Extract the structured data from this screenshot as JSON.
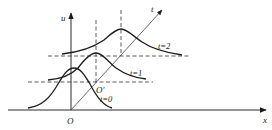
{
  "diagram": {
    "title": "",
    "axes": {
      "u_label": "u",
      "x_label": "x",
      "t_label": "t",
      "origin_label": "O",
      "moving_origin_label": "O′"
    },
    "curves": [
      {
        "label": "t=0",
        "peak_x": 74,
        "peak_y": 68
      },
      {
        "label": "t=1",
        "peak_x": 96,
        "peak_y": 53
      },
      {
        "label": "t=2",
        "peak_x": 121,
        "peak_y": 29
      }
    ],
    "colors": {
      "line": "#1e1e1e",
      "background": "#ffffff"
    }
  }
}
